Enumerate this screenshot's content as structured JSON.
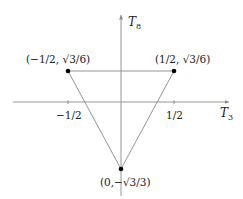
{
  "diagram": {
    "colors": {
      "axis": "#8a8a8a",
      "triangle": "#8a8a8a",
      "point": "#000000",
      "text": "#222222"
    },
    "axes": {
      "x": {
        "label": "T",
        "subscript": "3",
        "ticks": [
          "−1/2",
          "1/2"
        ]
      },
      "y": {
        "label": "T",
        "subscript": "8"
      }
    },
    "points": [
      {
        "id": "left",
        "label": "(−1/2, √3/6)"
      },
      {
        "id": "right",
        "label": "(1/2, √3/6)"
      },
      {
        "id": "bottom",
        "label": "(0,−√3/3)"
      }
    ]
  }
}
